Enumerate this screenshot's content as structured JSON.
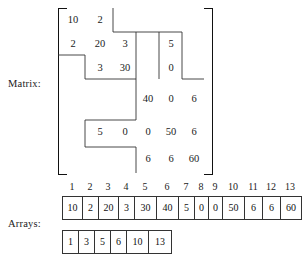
{
  "figure": {
    "matrix_label": "Matrix:",
    "arrays_label": "Arrays:",
    "caption": ""
  },
  "matrix": {
    "rows": 6,
    "cols": 6,
    "cells": [
      {
        "row": 1,
        "col": 1,
        "value": "10"
      },
      {
        "row": 1,
        "col": 2,
        "value": "2"
      },
      {
        "row": 2,
        "col": 1,
        "value": "2"
      },
      {
        "row": 2,
        "col": 2,
        "value": "20"
      },
      {
        "row": 2,
        "col": 3,
        "value": "3"
      },
      {
        "row": 2,
        "col": 5,
        "value": "5"
      },
      {
        "row": 3,
        "col": 2,
        "value": "3"
      },
      {
        "row": 3,
        "col": 3,
        "value": "30"
      },
      {
        "row": 3,
        "col": 5,
        "value": "0"
      },
      {
        "row": 4,
        "col": 4,
        "value": "40"
      },
      {
        "row": 4,
        "col": 5,
        "value": "0"
      },
      {
        "row": 4,
        "col": 6,
        "value": "6"
      },
      {
        "row": 5,
        "col": 2,
        "value": "5"
      },
      {
        "row": 5,
        "col": 3,
        "value": "0"
      },
      {
        "row": 5,
        "col": 4,
        "value": "0"
      },
      {
        "row": 5,
        "col": 5,
        "value": "50"
      },
      {
        "row": 5,
        "col": 6,
        "value": "6"
      },
      {
        "row": 6,
        "col": 4,
        "value": "6"
      },
      {
        "row": 6,
        "col": 5,
        "value": "6"
      },
      {
        "row": 6,
        "col": 6,
        "value": "60"
      }
    ]
  },
  "arrays": {
    "index_labels": [
      "1",
      "2",
      "3",
      "4",
      "5",
      "6",
      "7",
      "8",
      "9",
      "10",
      "11",
      "12",
      "13"
    ],
    "values_array": {
      "name": "values",
      "cells": [
        "10",
        "2",
        "20",
        "3",
        "30",
        "40",
        "5",
        "0",
        "0",
        "50",
        "6",
        "6",
        "60"
      ]
    },
    "pointer_array": {
      "name": "pointers",
      "cells": [
        "1",
        "3",
        "5",
        "6",
        "10",
        "13"
      ]
    }
  },
  "chart_data": {
    "type": "table",
    "matrix_values": [
      [
        "10",
        "2",
        "",
        "",
        "",
        ""
      ],
      [
        "2",
        "20",
        "3",
        "",
        "5",
        ""
      ],
      [
        "",
        "3",
        "30",
        "",
        "0",
        ""
      ],
      [
        "",
        "",
        "",
        "40",
        "0",
        "6"
      ],
      [
        "",
        "5",
        "0",
        "0",
        "50",
        "6"
      ],
      [
        "",
        "",
        "",
        "6",
        "6",
        "60"
      ]
    ],
    "values_array": [
      "10",
      "2",
      "20",
      "3",
      "30",
      "40",
      "5",
      "0",
      "0",
      "50",
      "6",
      "6",
      "60"
    ],
    "index_labels": [
      "1",
      "2",
      "3",
      "4",
      "5",
      "6",
      "7",
      "8",
      "9",
      "10",
      "11",
      "12",
      "13"
    ],
    "pointer_array": [
      "1",
      "3",
      "5",
      "6",
      "10",
      "13"
    ]
  }
}
